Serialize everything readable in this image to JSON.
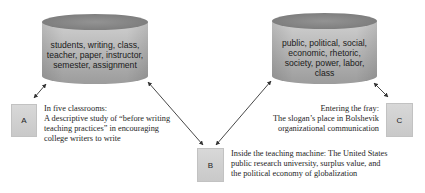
{
  "cylinders": [
    {
      "id": "left",
      "lines": [
        "students, writing, class,",
        "teacher, paper, instructor,",
        "semester, assignment"
      ]
    },
    {
      "id": "right",
      "lines": [
        "public, political, social,",
        "economic, rhetoric,",
        "society, power, labor,",
        "class"
      ]
    }
  ],
  "nodes": [
    {
      "label": "A",
      "description": [
        "In five classrooms:",
        "A descriptive study of “before writing",
        "teaching practices” in encouraging",
        "college writers to write"
      ]
    },
    {
      "label": "B",
      "description": [
        "Inside the teaching machine: The United States",
        "public research university, surplus value, and",
        "the political economy of globalization"
      ]
    },
    {
      "label": "C",
      "description": [
        "Entering the fray:",
        "The slogan’s place in Bolshevik",
        "organizational communication"
      ]
    }
  ],
  "connections": [
    {
      "from": "left-cylinder",
      "to": "A",
      "type": "bidirectional"
    },
    {
      "from": "left-cylinder",
      "to": "B",
      "type": "bidirectional"
    },
    {
      "from": "right-cylinder",
      "to": "B",
      "type": "bidirectional"
    },
    {
      "from": "right-cylinder",
      "to": "C",
      "type": "bidirectional"
    }
  ],
  "colors": {
    "cylinder_top": "#8a8a8a",
    "cylinder_body_light": "#c4c4c4",
    "cylinder_body_dark": "#9a9a9a",
    "box_fill": "#d0d0d0",
    "arrow": "#333333"
  }
}
